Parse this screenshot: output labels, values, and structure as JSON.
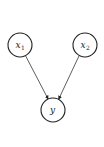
{
  "diagram": {
    "type": "directed-graph",
    "nodes": [
      {
        "id": "x1",
        "label": "x",
        "subscript": "1",
        "cx": 20,
        "cy": 45,
        "r": 12
      },
      {
        "id": "x2",
        "label": "x",
        "subscript": "2",
        "cx": 85,
        "cy": 45,
        "r": 12
      },
      {
        "id": "y",
        "label": "y",
        "subscript": "",
        "cx": 53,
        "cy": 110,
        "r": 12
      }
    ],
    "edges": [
      {
        "from": "x1",
        "to": "y"
      },
      {
        "from": "x2",
        "to": "y"
      }
    ],
    "colors": {
      "stroke": "#222222",
      "background": "#ffffff"
    }
  }
}
